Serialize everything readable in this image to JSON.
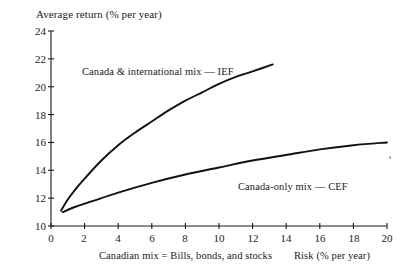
{
  "chart_data": {
    "type": "line",
    "title": "",
    "ylabel": "Average return (% per year)",
    "xlabel": "Risk (% per year)",
    "xlabel_secondary": "Canadian mix = Bills, bonds, and stocks",
    "xlim": [
      0,
      20
    ],
    "ylim": [
      10,
      24
    ],
    "xticks": [
      0,
      2,
      4,
      6,
      8,
      10,
      12,
      14,
      16,
      18,
      20
    ],
    "yticks": [
      10,
      12,
      14,
      16,
      18,
      20,
      22,
      24
    ],
    "grid": false,
    "legend_position": "inline-annotations",
    "series": [
      {
        "name": "Canada & international mix — IEF",
        "label": "Canada & international mix — IEF",
        "points": [
          {
            "x": 0.6,
            "y": 11.1
          },
          {
            "x": 1.0,
            "y": 11.9
          },
          {
            "x": 1.5,
            "y": 12.7
          },
          {
            "x": 2.0,
            "y": 13.4
          },
          {
            "x": 3.0,
            "y": 14.7
          },
          {
            "x": 4.0,
            "y": 15.8
          },
          {
            "x": 5.0,
            "y": 16.7
          },
          {
            "x": 6.0,
            "y": 17.5
          },
          {
            "x": 7.0,
            "y": 18.3
          },
          {
            "x": 8.0,
            "y": 19.0
          },
          {
            "x": 9.0,
            "y": 19.6
          },
          {
            "x": 10.0,
            "y": 20.2
          },
          {
            "x": 11.0,
            "y": 20.7
          },
          {
            "x": 12.0,
            "y": 21.1
          },
          {
            "x": 13.2,
            "y": 21.6
          }
        ]
      },
      {
        "name": "Canada-only mix — CEF",
        "label": "Canada-only mix — CEF",
        "points": [
          {
            "x": 0.7,
            "y": 11.0
          },
          {
            "x": 1.5,
            "y": 11.4
          },
          {
            "x": 2.5,
            "y": 11.8
          },
          {
            "x": 4.0,
            "y": 12.4
          },
          {
            "x": 6.0,
            "y": 13.1
          },
          {
            "x": 8.0,
            "y": 13.7
          },
          {
            "x": 10.0,
            "y": 14.2
          },
          {
            "x": 12.0,
            "y": 14.7
          },
          {
            "x": 14.0,
            "y": 15.1
          },
          {
            "x": 16.0,
            "y": 15.5
          },
          {
            "x": 18.0,
            "y": 15.8
          },
          {
            "x": 20.0,
            "y": 16.0
          }
        ]
      }
    ]
  },
  "axes": {
    "y_title": "Average return (% per year)",
    "y_ticks": [
      "24",
      "22",
      "20",
      "18",
      "16",
      "14",
      "12",
      "10"
    ],
    "x_ticks": [
      "0",
      "2",
      "4",
      "6",
      "8",
      "10",
      "12",
      "14",
      "16",
      "18",
      "20"
    ],
    "x_label_left": "Canadian mix = Bills, bonds, and stocks",
    "x_label_right": "Risk (% per year)"
  },
  "annotations": {
    "ief_label": "Canada & international mix — IEF",
    "cef_label": "Canada-only mix — CEF"
  },
  "colors": {
    "background": "#ffffff",
    "axis": "#1a1a1a",
    "curve": "#111111",
    "text": "#1a1a1a"
  }
}
